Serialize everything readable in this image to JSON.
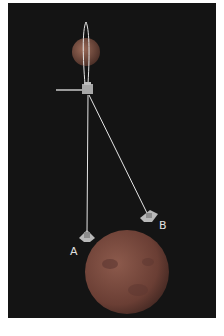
{
  "figure": {
    "labels": {
      "a": "A",
      "b": "B"
    },
    "colors": {
      "background": "#141414",
      "frame": "#ffffff",
      "lines": "#e6e6e6",
      "small_planet": "#8a5a4a",
      "large_planet": "#7a4a40",
      "label": "#e0e0e0"
    }
  }
}
